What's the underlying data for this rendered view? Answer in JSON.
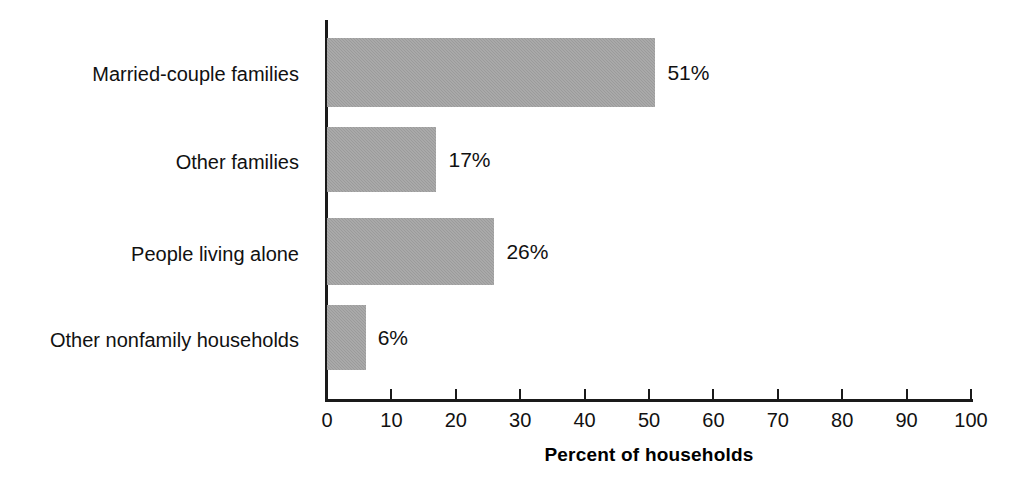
{
  "chart_data": {
    "type": "bar",
    "orientation": "horizontal",
    "title": "",
    "xlabel": "Percent of households",
    "ylabel": "Type of household",
    "categories": [
      "Married-couple families",
      "Other families",
      "People living alone",
      "Other nonfamily households"
    ],
    "values": [
      51,
      17,
      26,
      6
    ],
    "data_labels": [
      "51%",
      "17%",
      "26%",
      "6%"
    ],
    "xlim": [
      0,
      100
    ],
    "xticks": [
      0,
      10,
      20,
      30,
      40,
      50,
      60,
      70,
      80,
      90,
      100
    ],
    "xtick_labels": [
      "0",
      "10",
      "20",
      "30",
      "40",
      "50",
      "60",
      "70",
      "80",
      "90",
      "100"
    ],
    "grid": false,
    "legend": null,
    "bar_color": "#9b9b9b",
    "axis_color": "#1a1a1a",
    "background": "#ffffff"
  }
}
